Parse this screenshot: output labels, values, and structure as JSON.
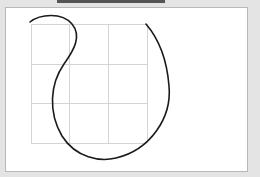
{
  "diagram": {
    "grid": {
      "x_lines": [
        31,
        69,
        108,
        147
      ],
      "y_lines": [
        24,
        64,
        103,
        143
      ],
      "color": "#d4d4d4"
    },
    "curve": {
      "color": "#1a1a1a",
      "stroke_width": 1.6,
      "path": "M 30 22 C 40 14, 62 12, 72 24 C 82 36, 74 50, 64 64 C 50 84, 48 112, 62 136 C 76 158, 100 162, 116 158 C 150 150, 172 118, 169 86 C 167 60, 158 38, 146 24"
    }
  }
}
